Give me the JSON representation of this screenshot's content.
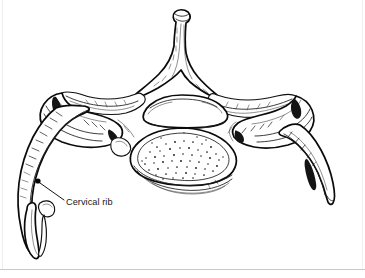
{
  "figure": {
    "kind": "anatomical-line-drawing",
    "view": "superior",
    "background_color": "#ffffff",
    "ink_color": "#111111",
    "width_px": 365,
    "height_px": 278
  },
  "annotations": {
    "callouts": [
      {
        "id": "cervical-rib",
        "label": "Cervical rib",
        "marker_shape": "filled-dot",
        "marker_x": 38,
        "marker_y": 181,
        "leader_from_x": 40,
        "leader_from_y": 183,
        "leader_to_x": 64,
        "leader_to_y": 200,
        "text_x": 66,
        "text_y": 205,
        "text_color": "#161616",
        "font_size_px": 9.2
      }
    ]
  },
  "structures": [
    {
      "id": "spinous-process",
      "name": "Spinous process",
      "position": "top-center"
    },
    {
      "id": "vertebral-foramen",
      "name": "Vertebral foramen",
      "position": "center-upper"
    },
    {
      "id": "vertebral-body",
      "name": "Vertebral body",
      "position": "center",
      "texture": "stippled cancellous bone"
    },
    {
      "id": "lamina-left",
      "name": "Left lamina",
      "position": "upper-left-of-center"
    },
    {
      "id": "lamina-right",
      "name": "Right lamina",
      "position": "upper-right-of-center"
    },
    {
      "id": "transverse-process-left",
      "name": "Left transverse process",
      "position": "left"
    },
    {
      "id": "transverse-process-right",
      "name": "Right transverse process",
      "position": "right"
    },
    {
      "id": "cervical-rib-left",
      "name": "Cervical rib (left)",
      "position": "lower-left"
    },
    {
      "id": "rib-right",
      "name": "Rib (right)",
      "position": "lower-right"
    }
  ],
  "decor": {
    "bottom_rule_color": "#c9c9c9",
    "bottom_rule_y": 269,
    "side_rule_color": "#ededed"
  }
}
